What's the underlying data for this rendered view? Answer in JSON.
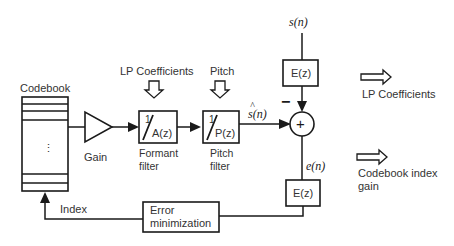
{
  "diagram": {
    "codebook": {
      "label": "Codebook",
      "ellipsis": "⋮"
    },
    "gain": {
      "label": "Gain"
    },
    "formant_filter": {
      "input_label": "LP Coefficients",
      "numerator": "1",
      "denominator": "A(z)",
      "caption_line1": "Formant",
      "caption_line2": "filter"
    },
    "pitch_filter": {
      "input_label": "Pitch",
      "numerator": "1",
      "denominator": "P(z)",
      "caption_line1": "Pitch",
      "caption_line2": "filter"
    },
    "synth_output": {
      "label_hat": "^",
      "label": "s(n)"
    },
    "input_signal": {
      "label": "s(n)"
    },
    "weighting_top": {
      "label": "E(z)"
    },
    "summing_junction": {
      "symbol": "+",
      "minus_sign": "−"
    },
    "error_signal": {
      "label": "e(n)"
    },
    "weighting_bottom": {
      "label": "E(z)"
    },
    "error_minimization": {
      "line1": "Error",
      "line2": "minimization"
    },
    "feedback": {
      "label": "Index"
    },
    "outputs": [
      {
        "label_line1": "LP Coefficients",
        "label_line2": ""
      },
      {
        "label_line1": "Codebook index",
        "label_line2": "gain"
      }
    ]
  }
}
